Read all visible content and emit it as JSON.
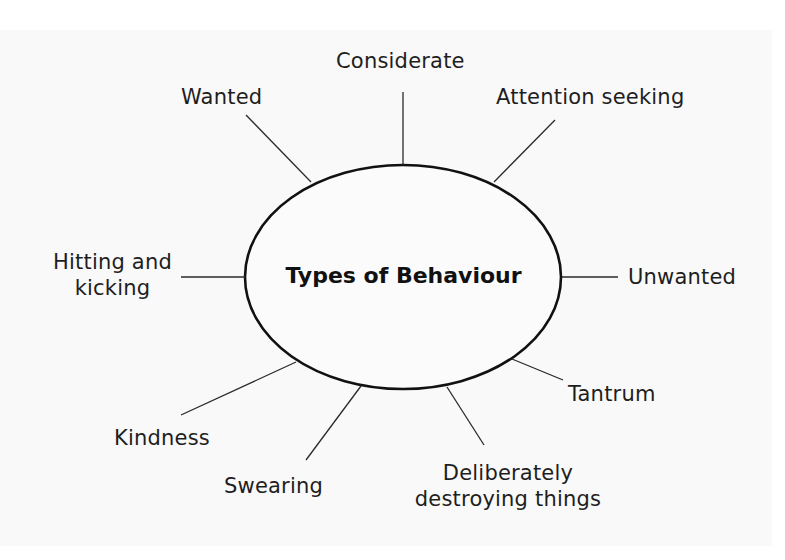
{
  "diagram": {
    "type": "spider-diagram",
    "title": "Types of Behaviour",
    "colors": {
      "background": "#f9f9f9",
      "outer_background": "#ffffff",
      "stroke": "#111111",
      "text": "#1e1e1e"
    },
    "center_ellipse": {
      "cx": 403,
      "cy": 277,
      "rx": 158,
      "ry": 112
    },
    "branches": [
      {
        "label": "Considerate",
        "line": [
          403,
          92,
          403,
          165
        ]
      },
      {
        "label": "Wanted",
        "line": [
          246,
          115,
          311,
          182
        ]
      },
      {
        "label": "Attention seeking",
        "line": [
          555,
          120,
          494,
          182
        ]
      },
      {
        "label": "Hitting and kicking",
        "line_1": "Hitting and",
        "line_2": "kicking",
        "line": [
          181,
          277,
          245,
          277
        ]
      },
      {
        "label": "Unwanted",
        "line": [
          562,
          277,
          618,
          277
        ]
      },
      {
        "label": "Kindness",
        "line": [
          181,
          415,
          296,
          362
        ]
      },
      {
        "label": "Swearing",
        "line": [
          306,
          460,
          361,
          386
        ]
      },
      {
        "label": "Deliberately destroying things",
        "line_1": "Deliberately",
        "line_2": "destroying things",
        "line": [
          484,
          445,
          447,
          387
        ]
      },
      {
        "label": "Tantrum",
        "line": [
          563,
          380,
          512,
          359
        ]
      }
    ]
  }
}
